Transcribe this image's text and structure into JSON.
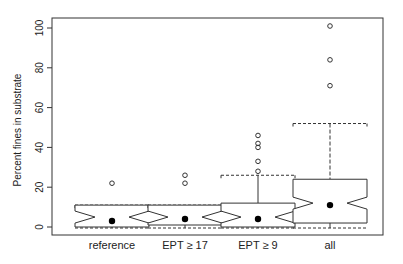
{
  "chart_data": {
    "type": "box",
    "title": "",
    "xlabel": "",
    "ylabel": "Percent fines in substrate",
    "ylim": [
      0,
      100
    ],
    "yticks": [
      0,
      20,
      40,
      60,
      80,
      100
    ],
    "categories": [
      "reference",
      "EPT ≥ 17",
      "EPT ≥ 9",
      "all"
    ],
    "boxes": [
      {
        "name": "reference",
        "whisker_low": 0,
        "q1": 0,
        "median": 5,
        "q3": 11,
        "whisker_high": 11,
        "mean": 3,
        "outliers": [
          22
        ]
      },
      {
        "name": "EPT ≥ 17",
        "whisker_low": 0,
        "q1": 1,
        "median": 5,
        "q3": 11,
        "whisker_high": 11,
        "mean": 4,
        "outliers": [
          22,
          26
        ]
      },
      {
        "name": "EPT ≥ 9",
        "whisker_low": 0,
        "q1": 0,
        "median": 5,
        "q3": 12,
        "whisker_high": 26,
        "mean": 4,
        "outliers": [
          28,
          33,
          40,
          42,
          46
        ]
      },
      {
        "name": "all",
        "whisker_low": 0,
        "q1": 2,
        "median": 12,
        "q3": 24,
        "whisker_high": 52,
        "mean": 11,
        "outliers": [
          71,
          84,
          101
        ]
      }
    ],
    "grid": false,
    "legend": null
  },
  "colors": {
    "line": "#333333",
    "background": "#ffffff"
  }
}
